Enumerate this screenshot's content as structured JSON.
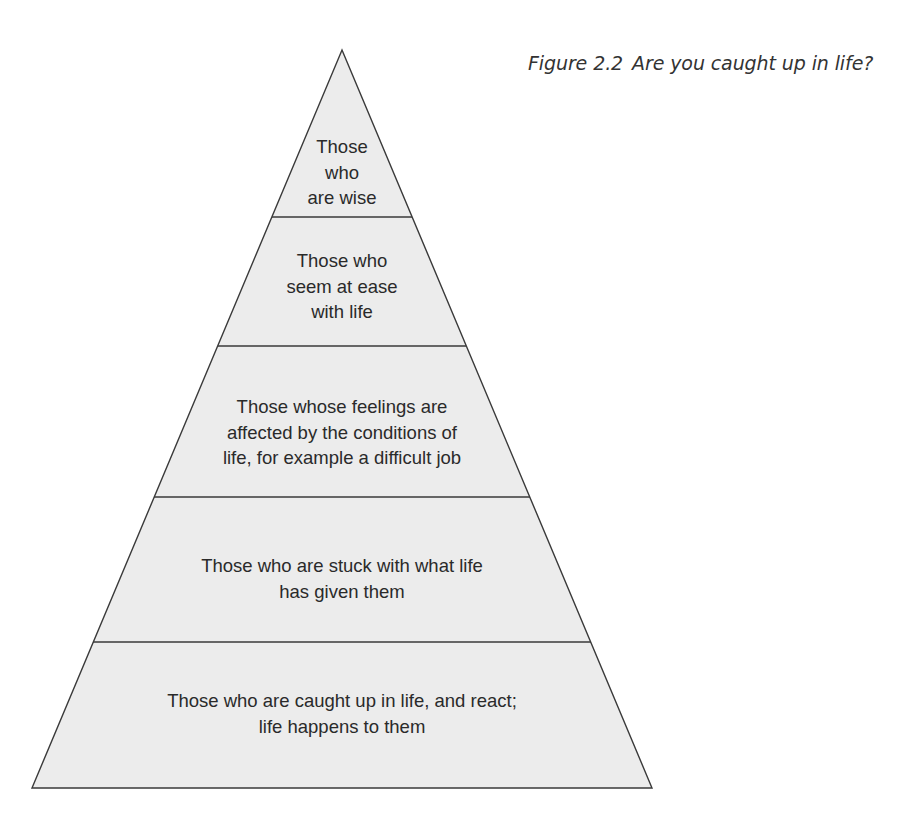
{
  "figure": {
    "label": "Figure 2.2",
    "title": "Are you caught up in life?"
  },
  "colors": {
    "fill": "#ececec",
    "stroke": "#3a3a3a",
    "text": "#2a2a2a",
    "background": "#ffffff"
  },
  "pyramid": {
    "apex": [
      342,
      50
    ],
    "base_y": 788,
    "base_x": [
      32,
      652
    ],
    "divider_y": [
      217,
      346,
      497,
      642
    ],
    "levels": [
      {
        "lines": [
          "Those",
          "who",
          "are wise"
        ]
      },
      {
        "lines": [
          "Those who",
          "seem at ease",
          "with life"
        ]
      },
      {
        "lines": [
          "Those whose feelings are",
          "affected by the conditions of",
          "life, for example a difficult job"
        ]
      },
      {
        "lines": [
          "Those who are stuck with what life",
          "has given them"
        ]
      },
      {
        "lines": [
          "Those who are caught up in life, and react;",
          "life happens to them"
        ]
      }
    ]
  }
}
